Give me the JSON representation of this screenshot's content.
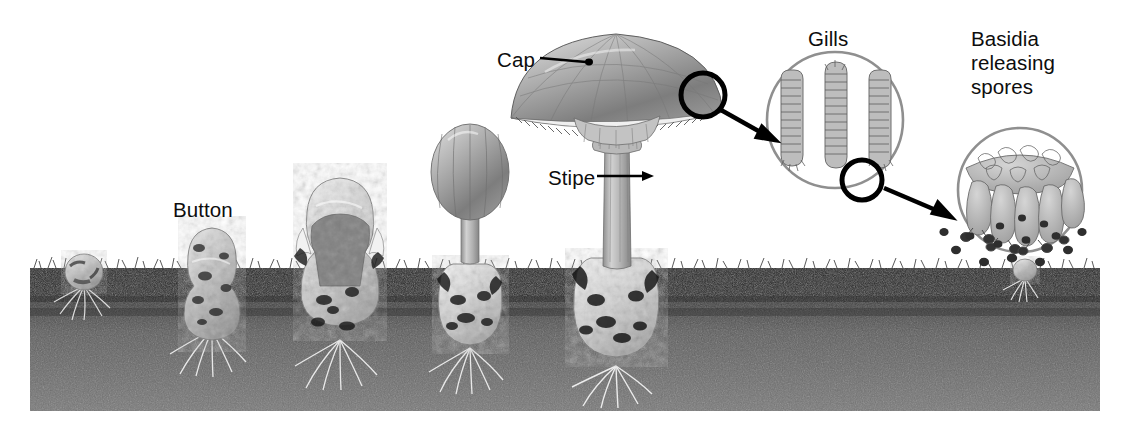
{
  "figure": {
    "background_color": "#ffffff",
    "ink_color": "#0d0d0d"
  },
  "labels": {
    "cap": "Cap",
    "button": "Button",
    "stipe": "Stipe",
    "gills": "Gills",
    "basidia": "Basidia\nreleasing\nspores"
  },
  "soil": {
    "surface_color": "#2b2b2b",
    "body_color": "#6e6e6e",
    "x": 30,
    "top_y": 268,
    "bottom_y": 411,
    "right_x": 1100
  },
  "stages": [
    {
      "name": "primordium-button-underground",
      "center_x": 84,
      "ground_y": 268,
      "size": "small"
    },
    {
      "name": "button-emerging",
      "center_x": 212,
      "ground_y": 268,
      "size": "medium"
    },
    {
      "name": "veil-rupturing",
      "center_x": 340,
      "ground_y": 268,
      "size": "large"
    },
    {
      "name": "elongating-unopened-cap",
      "center_x": 470,
      "ground_y": 268,
      "size": "large"
    },
    {
      "name": "mature-fruiting-body",
      "center_x": 616,
      "ground_y": 268,
      "size": "full"
    },
    {
      "name": "new-spore-germinating",
      "center_x": 1025,
      "ground_y": 268,
      "size": "tiny"
    }
  ],
  "callouts": [
    {
      "name": "gills-inset",
      "label_key": "gills",
      "circle_cx": 835,
      "circle_cy": 120,
      "circle_r": 68,
      "outline_color": "#8c8c8c"
    },
    {
      "name": "basidia-inset",
      "label_key": "basidia",
      "circle_cx": 1020,
      "circle_cy": 190,
      "circle_r": 62,
      "outline_color": "#8c8c8c"
    }
  ],
  "markers": [
    {
      "name": "cap-edge-marker",
      "cx": 703,
      "cy": 95,
      "r": 22,
      "color": "#000000"
    },
    {
      "name": "gill-tip-marker",
      "cx": 862,
      "cy": 180,
      "r": 20,
      "color": "#000000"
    }
  ],
  "arrows": [
    {
      "name": "arrow-cap-to-gills",
      "x1": 722,
      "y1": 110,
      "x2": 772,
      "y2": 138
    },
    {
      "name": "arrow-gills-to-basidia",
      "x1": 884,
      "y1": 188,
      "x2": 948,
      "y2": 215
    }
  ],
  "leader_lines": [
    {
      "name": "cap-leader",
      "x1": 540,
      "y1": 58,
      "x2": 592,
      "y2": 64
    },
    {
      "name": "stipe-leader",
      "x1": 596,
      "y1": 176,
      "x2": 650,
      "y2": 176
    },
    {
      "name": "button-pointer",
      "x1": 0,
      "y1": 0,
      "x2": 0,
      "y2": 0
    }
  ],
  "spores": {
    "count": 14,
    "color": "#2e2e2e",
    "description": "dark spores falling from basidia inset toward the soil"
  }
}
